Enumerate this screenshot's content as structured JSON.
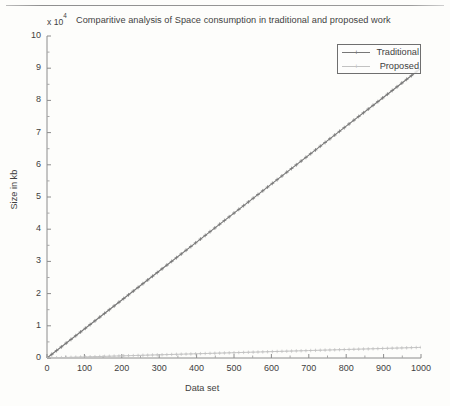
{
  "page": {
    "background_color": "#fdfdfb",
    "ink_color": "#3f3f3f",
    "top_rule": "horizontal-rule"
  },
  "chart_data": {
    "type": "line",
    "title": "Comparitive analysis of Space consumption in traditional and proposed work",
    "y_multiplier": "x 10",
    "y_multiplier_exponent": "4",
    "xlabel": "Data set",
    "ylabel": "Size in kb",
    "xlim": [
      0,
      1000
    ],
    "ylim": [
      0,
      10
    ],
    "xticks": [
      0,
      100,
      200,
      300,
      400,
      500,
      600,
      700,
      800,
      900,
      1000
    ],
    "xtick_labels": [
      "0",
      "100",
      "200",
      "300",
      "400",
      "500",
      "600",
      "700",
      "800",
      "900",
      "1000"
    ],
    "yticks": [
      0,
      1,
      2,
      3,
      4,
      5,
      6,
      7,
      8,
      9,
      10
    ],
    "ytick_labels": [
      "0",
      "1",
      "2",
      "3",
      "4",
      "5",
      "6",
      "7",
      "8",
      "9",
      "10"
    ],
    "grid": false,
    "legend_position": "upper right",
    "marker": "+",
    "x": [
      0,
      100,
      200,
      300,
      400,
      500,
      600,
      700,
      800,
      900,
      1000
    ],
    "series": [
      {
        "name": "Traditional",
        "color": "#777777",
        "values": [
          0,
          9000,
          18000,
          27000,
          36000,
          45000,
          54000,
          63000,
          72000,
          81000,
          90000
        ]
      },
      {
        "name": "Proposed",
        "color": "#c2c2c2",
        "values": [
          0,
          330,
          660,
          990,
          1320,
          1650,
          1980,
          2310,
          2640,
          2970,
          3300
        ]
      }
    ],
    "legend": [
      {
        "label": "Traditional",
        "color": "#777777"
      },
      {
        "label": "Proposed",
        "color": "#c2c2c2"
      }
    ]
  }
}
